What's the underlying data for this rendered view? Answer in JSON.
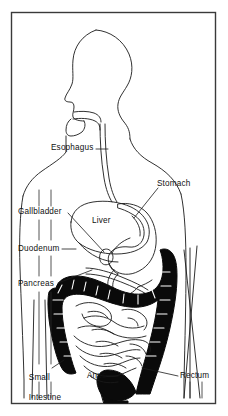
{
  "figure": {
    "view": "lateral profile of head, neck and torso facing left",
    "frame": {
      "border_color": "#3a3a3a",
      "background_color": "#ffffff",
      "x": 11,
      "y": 12,
      "width": 205,
      "height": 392
    },
    "style": {
      "line_color": "#1a1a1a",
      "fill_dark": "#0a0a0a",
      "fill_light": "#ffffff",
      "label_color": "#111111"
    }
  },
  "labels": [
    {
      "id": "esophagus",
      "text": "Esophagus",
      "x": 51,
      "y": 146,
      "leader": "horizontal-right"
    },
    {
      "id": "stomach",
      "text": "Stomach",
      "x": 157,
      "y": 182,
      "leader": "diagonal-down-left"
    },
    {
      "id": "gallbladder",
      "text": "Gallbladder",
      "x": 18,
      "y": 209,
      "leader": "diagonal-down-right"
    },
    {
      "id": "liver",
      "text": "Liver",
      "x": 92,
      "y": 219,
      "leader": "none"
    },
    {
      "id": "duodenum",
      "text": "Duodenum",
      "x": 18,
      "y": 246,
      "leader": "horizontal-right"
    },
    {
      "id": "pancreas",
      "text": "Pancreas",
      "x": 18,
      "y": 281,
      "leader": "diagonal-up-right"
    },
    {
      "id": "small-intestine",
      "text": "Small",
      "text2": "Intestine",
      "x": 19,
      "y": 366,
      "leader": "diagonal-up-right"
    },
    {
      "id": "anus",
      "text": "Anus",
      "x": 87,
      "y": 373,
      "leader": "horizontal-right"
    },
    {
      "id": "rectum",
      "text": "Rectum",
      "x": 180,
      "y": 373,
      "leader": "horizontal-left"
    }
  ],
  "organs": [
    {
      "id": "body-outline",
      "name": "Body profile outline",
      "shading": "outline"
    },
    {
      "id": "oral-cavity",
      "name": "Mouth / oral cavity",
      "shading": "outline"
    },
    {
      "id": "esophagus-tube",
      "name": "Esophagus",
      "shading": "outline"
    },
    {
      "id": "liver-organ",
      "name": "Liver",
      "shading": "outline"
    },
    {
      "id": "gallbladder-organ",
      "name": "Gallbladder",
      "shading": "outline"
    },
    {
      "id": "stomach-organ",
      "name": "Stomach",
      "shading": "outline"
    },
    {
      "id": "duodenum-organ",
      "name": "Duodenum",
      "shading": "outline"
    },
    {
      "id": "pancreas-organ",
      "name": "Pancreas",
      "shading": "outline"
    },
    {
      "id": "large-intestine",
      "name": "Large intestine / colon",
      "shading": "solid-black"
    },
    {
      "id": "small-intestine-coils",
      "name": "Small intestine coils",
      "shading": "outline"
    },
    {
      "id": "rectum-organ",
      "name": "Rectum",
      "shading": "solid-black"
    },
    {
      "id": "anus-organ",
      "name": "Anus",
      "shading": "solid-black"
    }
  ]
}
